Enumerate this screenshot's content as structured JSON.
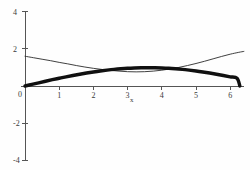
{
  "chart_data": {
    "type": "line",
    "title": "",
    "subtitle": "",
    "xlabel": "x",
    "ylabel": "",
    "xlim": [
      -0.15,
      6.45
    ],
    "ylim": [
      -4.3,
      4.3
    ],
    "grid": false,
    "legend": null,
    "x_ticks": [
      0,
      1,
      2,
      3,
      4,
      5,
      6
    ],
    "x_tick_labels": [
      "0",
      "1",
      "2",
      "3",
      "4",
      "5",
      "6"
    ],
    "y_ticks": [
      -4,
      -2,
      2,
      4
    ],
    "y_tick_labels": [
      "-4",
      "-2",
      "2",
      "4"
    ],
    "series": [
      {
        "name": "thick-curve",
        "style": "thick",
        "color": "#101010",
        "x": [
          0.0,
          0.2,
          0.4,
          0.6,
          0.8,
          1.0,
          1.2,
          1.4,
          1.6,
          1.8,
          2.0,
          2.2,
          2.4,
          2.6,
          2.8,
          3.0,
          3.2,
          3.4,
          3.6,
          3.8,
          4.0,
          4.2,
          4.4,
          4.6,
          4.8,
          5.0,
          5.2,
          5.4,
          5.6,
          5.8,
          6.0,
          6.2,
          6.283
        ],
        "y": [
          0.0,
          0.086,
          0.172,
          0.256,
          0.338,
          0.417,
          0.494,
          0.566,
          0.634,
          0.697,
          0.755,
          0.807,
          0.853,
          0.893,
          0.925,
          0.951,
          0.969,
          0.981,
          0.985,
          0.981,
          0.969,
          0.951,
          0.925,
          0.893,
          0.853,
          0.807,
          0.755,
          0.697,
          0.634,
          0.566,
          0.494,
          0.417,
          0.0
        ]
      },
      {
        "name": "thin-curve",
        "style": "thin",
        "color": "#2a2a2a",
        "x": [
          0.0,
          0.25,
          0.5,
          0.75,
          1.0,
          1.25,
          1.5,
          1.75,
          2.0,
          2.25,
          2.5,
          2.75,
          3.0,
          3.25,
          3.5,
          3.75,
          4.0,
          4.25,
          4.5,
          4.75,
          5.0,
          5.25,
          5.5,
          5.75,
          6.0,
          6.25,
          6.4
        ],
        "y": [
          1.6,
          1.52,
          1.44,
          1.36,
          1.27,
          1.19,
          1.1,
          1.02,
          0.95,
          0.89,
          0.84,
          0.8,
          0.77,
          0.76,
          0.77,
          0.8,
          0.85,
          0.92,
          1.0,
          1.1,
          1.21,
          1.33,
          1.46,
          1.59,
          1.71,
          1.81,
          1.86
        ]
      }
    ],
    "annotations": []
  },
  "figure": {
    "background_color": "#fefefe",
    "axis_color": "#555555",
    "origin_label": "0"
  }
}
